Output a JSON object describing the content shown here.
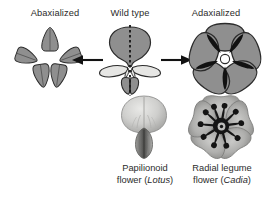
{
  "figure": {
    "background_color": "#ffffff",
    "top_labels": [
      {
        "id": "abaxialized",
        "text": "Abaxialized"
      },
      {
        "id": "wild-type",
        "text": "Wild type"
      },
      {
        "id": "adaxialized",
        "text": "Adaxialized"
      }
    ],
    "captions": [
      {
        "id": "papilionoid",
        "line1": "Papilionoid",
        "line2_prefix": "flower (",
        "line2_genus": "Lotus",
        "line2_suffix": ")"
      },
      {
        "id": "radial-legume",
        "line1": "Radial legume",
        "line2_prefix": "flower (",
        "line2_genus": "Cadia",
        "line2_suffix": ")"
      }
    ],
    "arrows": [
      {
        "id": "arrow-left",
        "direction": "left"
      },
      {
        "id": "arrow-right",
        "direction": "right"
      }
    ],
    "colors": {
      "petal_gray": "#8f8f8f",
      "petal_light": "#e6e6e4",
      "petal_dark": "#3a3a3a",
      "outline": "#2b2b2b",
      "black": "#121212",
      "photo_light": "#d7d7d5",
      "photo_mid": "#a8a8a6",
      "photo_dark": "#6a6a68",
      "text": "#2b2b2b"
    },
    "diagrams": {
      "abaxialized": {
        "symmetry": "radial",
        "petal_count": 5,
        "petal_type": "keel-like",
        "description": "five identical abaxial (keel-type) petals radiating from center"
      },
      "wild_type": {
        "symmetry": "bilateral",
        "petal_count": 5,
        "organs": [
          "standard",
          "wing",
          "wing",
          "keel",
          "keel"
        ],
        "dashed_axis": true,
        "description": "papilionoid flower with one dark standard, two light wings, two keel petals"
      },
      "adaxialized": {
        "symmetry": "radial",
        "petal_count": 5,
        "petal_type": "standard-like",
        "description": "five identical adaxial (standard-type) petals in radial arrangement"
      }
    },
    "photos": [
      {
        "id": "lotus-photo",
        "subject": "Papilionoid flower of Lotus",
        "style": "grayscale"
      },
      {
        "id": "cadia-photo",
        "subject": "Radial legume flower of Cadia",
        "style": "grayscale"
      }
    ]
  }
}
